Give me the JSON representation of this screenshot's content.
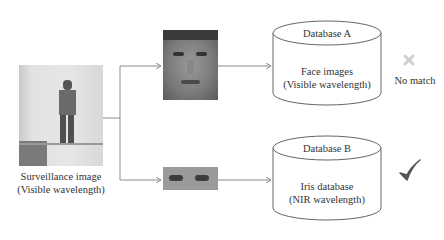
{
  "surveillance": {
    "caption_line1": "Surveillance image",
    "caption_line2": "(Visible wavelength)"
  },
  "probes": {
    "face": "face-crop",
    "periocular": "periocular-crop"
  },
  "database_a": {
    "title": "Database A",
    "line1": "Face images",
    "line2": "(Visible wavelength)",
    "result_icon": "cross-icon",
    "result_text": "No match"
  },
  "database_b": {
    "title": "Database B",
    "line1": "Iris database",
    "line2": "(NIR wavelength)",
    "result_icon": "check-icon"
  },
  "colors": {
    "line": "#8c8c8c",
    "cross": "#cfcfcf",
    "check": "#555555"
  }
}
